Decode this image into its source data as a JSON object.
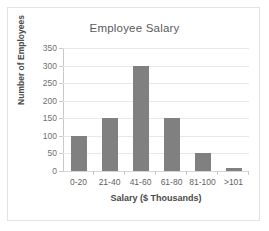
{
  "chart_data": {
    "type": "bar",
    "title": "Employee Salary",
    "xlabel": "Salary ($ Thousands)",
    "ylabel": "Number of Employees",
    "categories": [
      "0-20",
      "21-40",
      "41-60",
      "61-80",
      "81-100",
      ">101"
    ],
    "values": [
      100,
      150,
      300,
      150,
      50,
      10
    ],
    "ylim": [
      0,
      350
    ],
    "yticks": [
      0,
      50,
      100,
      150,
      200,
      250,
      300,
      350
    ],
    "ytick_labels": [
      "0",
      "50",
      "100",
      "150",
      "200",
      "250",
      "300",
      "350"
    ],
    "grid": true,
    "legend": false,
    "bar_color": "#808080",
    "gridline_color": "#e8e8e8",
    "axis_color": "#c9c9c9",
    "title_color": "#5a5a5a",
    "label_color": "#4a4a4a",
    "tick_color": "#6f6f6f",
    "background": "#ffffff",
    "frame_color": "#e3e3e3"
  }
}
